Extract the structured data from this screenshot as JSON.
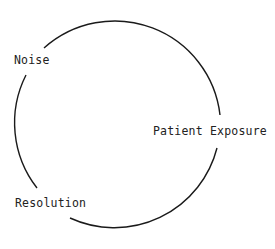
{
  "diagram": {
    "type": "cycle",
    "line_color": "#1a1a1a",
    "text_color": "#222222",
    "background": "#ffffff",
    "nodes": [
      {
        "label": "Noise"
      },
      {
        "label": "Patient Exposure"
      },
      {
        "label": "Resolution"
      }
    ]
  }
}
